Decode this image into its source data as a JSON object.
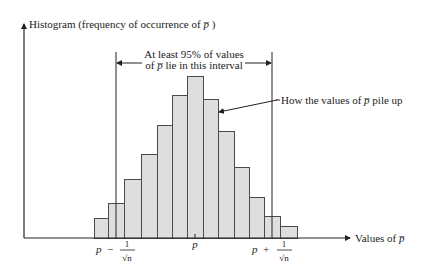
{
  "chart_data": {
    "type": "bar",
    "title": "",
    "ylabel": "Histogram (frequency of occurrence of p̅ )",
    "xlabel": "Values of p̅",
    "categories": [
      "b1",
      "b2",
      "b3",
      "b4",
      "b5",
      "b6",
      "b7",
      "b8",
      "b9",
      "b10",
      "b11",
      "b12",
      "b13"
    ],
    "values": [
      20,
      35,
      59,
      84,
      113,
      143,
      162,
      139,
      107,
      71,
      41,
      22,
      12
    ],
    "x_ticks": [
      {
        "label": "p − 1/√n",
        "position": "left-interval-bound"
      },
      {
        "label": "p",
        "position": "center"
      },
      {
        "label": "p + 1/√n",
        "position": "right-interval-bound"
      }
    ],
    "annotations": [
      {
        "text": "At least 95% of values of p̅ lie in this interval",
        "type": "interval-bracket"
      },
      {
        "text": "How the values of p̅ pile up",
        "type": "pointer"
      }
    ],
    "grid": false,
    "legend": null
  },
  "axis": {
    "y_label_prefix": "Histogram (frequency of occurrence of ",
    "y_label_var": "p̅",
    "y_label_suffix": " )",
    "x_label_prefix": "Values of ",
    "x_label_var": "p̅"
  },
  "interval": {
    "line1": "At least 95% of values",
    "line2_prefix": "of ",
    "line2_var": "p̅",
    "line2_suffix": "  lie in this interval"
  },
  "pointer": {
    "prefix": "How the values of ",
    "var": "p̅",
    "suffix": "  pile up"
  },
  "ticks": {
    "left_p": "p",
    "left_op": "−",
    "one": "1",
    "sqrt_n": "√n",
    "center_p": "p",
    "right_p": "p",
    "right_op": "+"
  },
  "bars": [
    {
      "x": 94,
      "w": 14,
      "top": 218
    },
    {
      "x": 108,
      "w": 16,
      "top": 203
    },
    {
      "x": 124,
      "w": 17,
      "top": 179
    },
    {
      "x": 141,
      "w": 16,
      "top": 154
    },
    {
      "x": 157,
      "w": 15,
      "top": 125
    },
    {
      "x": 172,
      "w": 15,
      "top": 95
    },
    {
      "x": 187,
      "w": 16,
      "top": 76
    },
    {
      "x": 203,
      "w": 15,
      "top": 99
    },
    {
      "x": 218,
      "w": 16,
      "top": 131
    },
    {
      "x": 234,
      "w": 15,
      "top": 167
    },
    {
      "x": 249,
      "w": 15,
      "top": 197
    },
    {
      "x": 264,
      "w": 16,
      "top": 216
    },
    {
      "x": 280,
      "w": 17,
      "top": 226
    }
  ]
}
